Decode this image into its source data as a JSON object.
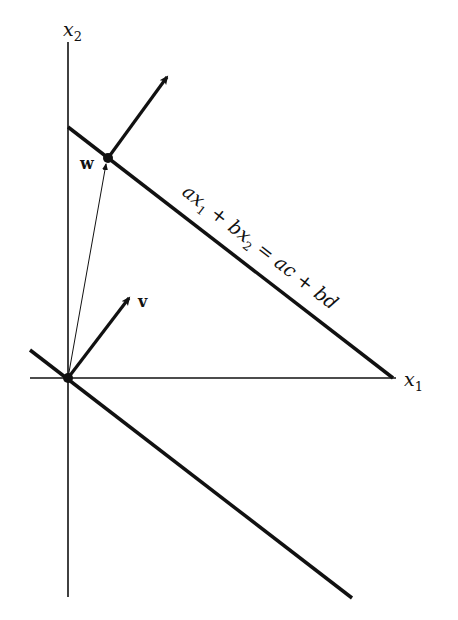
{
  "diagram": {
    "axes": {
      "x1_label": "x",
      "x1_sub": "1",
      "x2_label": "x",
      "x2_sub": "2"
    },
    "points": {
      "w_label": "w",
      "v_label": "v"
    },
    "equation": {
      "p1": "ax",
      "s1": "1",
      "p2": " + bx",
      "s2": "2",
      "p3": " = ac + bd"
    },
    "colors": {
      "ink": "#111111",
      "background": "#ffffff"
    }
  }
}
